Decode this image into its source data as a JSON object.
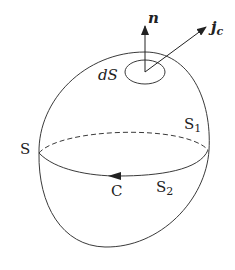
{
  "figure": {
    "type": "surface-integral-diagram",
    "labels": {
      "normal_vector": "n",
      "current_density_symbol": "j",
      "current_density_sub": "c",
      "surface_element": "dS",
      "surface": "S",
      "upper_surface_symbol": "S",
      "upper_surface_sub": "1",
      "lower_surface_symbol": "S",
      "lower_surface_sub": "2",
      "contour": "C"
    },
    "colors": {
      "stroke": "#3a3a3a",
      "text": "#222222",
      "background": "#ffffff"
    }
  }
}
